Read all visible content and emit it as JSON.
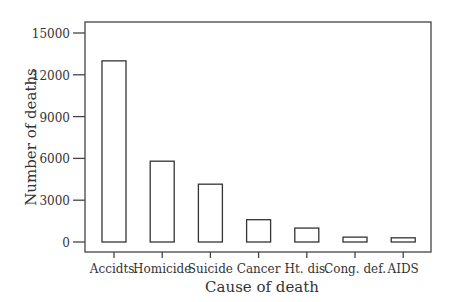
{
  "chart_data": {
    "type": "bar",
    "title": "",
    "xlabel": "Cause of death",
    "ylabel": "Number of deaths",
    "categories": [
      "Accidts.",
      "Homicide",
      "Suicide",
      "Cancer",
      "Ht. dis.",
      "Cong. def.",
      "AIDS"
    ],
    "values": [
      13000,
      5800,
      4150,
      1600,
      1000,
      350,
      300
    ],
    "ylim": [
      0,
      15000
    ],
    "yticks": [
      0,
      3000,
      6000,
      9000,
      12000,
      15000
    ],
    "ytick_labels": [
      "0",
      "3000",
      "6000",
      "9000",
      "12000",
      "15000"
    ],
    "grid": false,
    "legend": null,
    "bar_fill": "#ffffff",
    "bar_stroke": "#333333"
  }
}
